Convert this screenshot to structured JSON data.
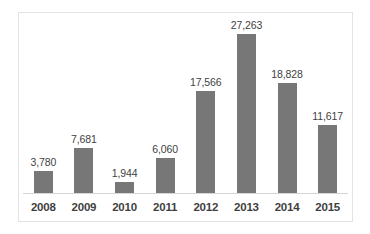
{
  "chart_data": {
    "type": "bar",
    "title": "",
    "subtitle": "",
    "xlabel": "",
    "ylabel": "",
    "categories": [
      "2008",
      "2009",
      "2010",
      "2011",
      "2012",
      "2013",
      "2014",
      "2015"
    ],
    "values": [
      3780,
      7681,
      1944,
      6060,
      17566,
      27263,
      18828,
      11617
    ],
    "value_labels": [
      "3,780",
      "7,681",
      "1,944",
      "6,060",
      "17,566",
      "27,263",
      "18,828",
      "11,617"
    ],
    "ylim": [
      0,
      27263
    ],
    "grid": false,
    "legend": false,
    "legend_position": "none",
    "axis_visible": {
      "x_axis_line": true,
      "y_axis_line": false,
      "y_tick_labels": false
    },
    "data_labels_shown": true,
    "colors": {
      "bar": "#777777",
      "axis_line": "#d6d6d6",
      "frame_border": "#e3e3e3",
      "label_text": "#3f3f3f",
      "background": "#ffffff"
    }
  }
}
